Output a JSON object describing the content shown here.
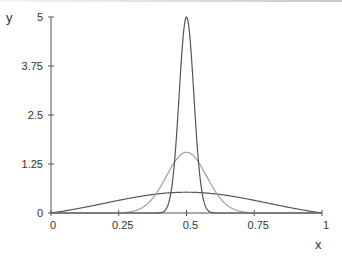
{
  "chart_data": {
    "type": "line",
    "title": "",
    "xlabel": "x",
    "ylabel": "y",
    "xlim": [
      0,
      1
    ],
    "ylim": [
      0,
      5
    ],
    "grid": false,
    "legend": "none",
    "x_ticks": [
      {
        "value": 0,
        "label": "0"
      },
      {
        "value": 0.25,
        "label": "0.25"
      },
      {
        "value": 0.5,
        "label": "0.5"
      },
      {
        "value": 0.75,
        "label": "0.75"
      },
      {
        "value": 1,
        "label": "1"
      }
    ],
    "y_ticks": [
      {
        "value": 0,
        "label": "0"
      },
      {
        "value": 1.25,
        "label": "1.25"
      },
      {
        "value": 2.5,
        "label": "2.5"
      },
      {
        "value": 3.75,
        "label": "3.75"
      },
      {
        "value": 5,
        "label": "5"
      }
    ],
    "series": [
      {
        "name": "wide",
        "color": "#555555",
        "center": 0.5,
        "peak": 0.53,
        "sigma": 0.3,
        "zero_at_bounds": true,
        "sample_points": [
          [
            0,
            0
          ],
          [
            0.25,
            0.32
          ],
          [
            0.5,
            0.53
          ],
          [
            0.75,
            0.32
          ],
          [
            1,
            0
          ]
        ]
      },
      {
        "name": "medium",
        "color": "#a0a0a0",
        "center": 0.5,
        "peak": 1.55,
        "sigma": 0.074,
        "zero_at_bounds": false,
        "sample_points": [
          [
            0.25,
            0.0
          ],
          [
            0.4,
            0.62
          ],
          [
            0.5,
            1.55
          ],
          [
            0.6,
            0.62
          ],
          [
            0.75,
            0.0
          ]
        ]
      },
      {
        "name": "narrow",
        "color": "#555555",
        "center": 0.5,
        "peak": 5.0,
        "sigma": 0.027,
        "zero_at_bounds": false,
        "sample_points": [
          [
            0.4,
            0.0
          ],
          [
            0.468,
            2.5
          ],
          [
            0.5,
            5.0
          ],
          [
            0.532,
            2.5
          ],
          [
            0.6,
            0.0
          ]
        ]
      }
    ]
  },
  "layout": {
    "plot": {
      "x0": 51,
      "x1": 322,
      "y0": 213,
      "y1": 17
    },
    "axis_color": "#555555"
  }
}
